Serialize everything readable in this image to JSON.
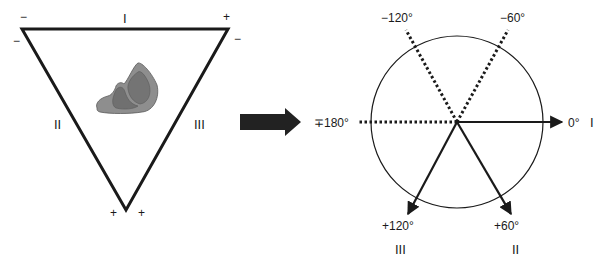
{
  "einthoven_triangle": {
    "lead_labels": {
      "top": "I",
      "left": "II",
      "right": "III"
    },
    "polarity": {
      "top_left_upper": "−",
      "top_left_lower": "−",
      "top_right_upper": "+",
      "top_right_lower": "−",
      "bottom_left": "+",
      "bottom_right": "+"
    },
    "heart_icon": "heart-icon"
  },
  "transition_arrow": "arrow-right-icon",
  "hexaxial_diagram": {
    "axes": [
      {
        "angle_label": "0°",
        "lead": "I",
        "style": "solid"
      },
      {
        "angle_label": "+60°",
        "lead": "II",
        "style": "solid"
      },
      {
        "angle_label": "+120°",
        "lead": "III",
        "style": "solid"
      },
      {
        "angle_label": "∓180°",
        "lead": "",
        "style": "dotted"
      },
      {
        "angle_label": "−120°",
        "lead": "",
        "style": "dotted"
      },
      {
        "angle_label": "−60°",
        "lead": "",
        "style": "dotted"
      }
    ]
  },
  "colors": {
    "line": "#1a1a1a",
    "heart_fill": "#8c8c8c",
    "heart_dark": "#6e6e6e",
    "arrow_fill": "#222222"
  }
}
